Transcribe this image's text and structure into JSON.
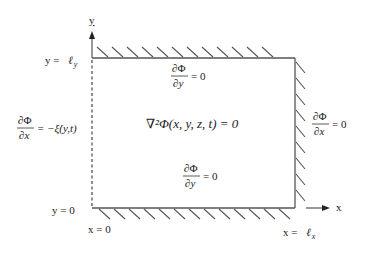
{
  "diagram": {
    "colors": {
      "line": "#555555",
      "text": "#222222",
      "background": "#ffffff"
    },
    "axes": {
      "y_label": "y",
      "x_label": "x"
    },
    "boundary_labels": {
      "top": {
        "prefix": "y = ",
        "symbol": "ℓ",
        "subscript": "y"
      },
      "bottom": "y = 0",
      "left": "x = 0",
      "right": {
        "prefix": "x = ",
        "symbol": "ℓ",
        "subscript": "x"
      }
    },
    "conditions": {
      "top": {
        "numerator": "∂Φ",
        "denominator": "∂y",
        "rhs": "= 0"
      },
      "bottom": {
        "numerator": "∂Φ",
        "denominator": "∂y",
        "rhs": "= 0"
      },
      "right": {
        "numerator": "∂Φ",
        "denominator": "∂x",
        "rhs": "= 0"
      },
      "left": {
        "numerator": "∂Φ",
        "denominator": "∂x",
        "rhs": "= −ξ̇(y,t)"
      }
    },
    "governing_equation": {
      "lhs": "∇²Φ(x, y, z, t) = 0"
    }
  }
}
